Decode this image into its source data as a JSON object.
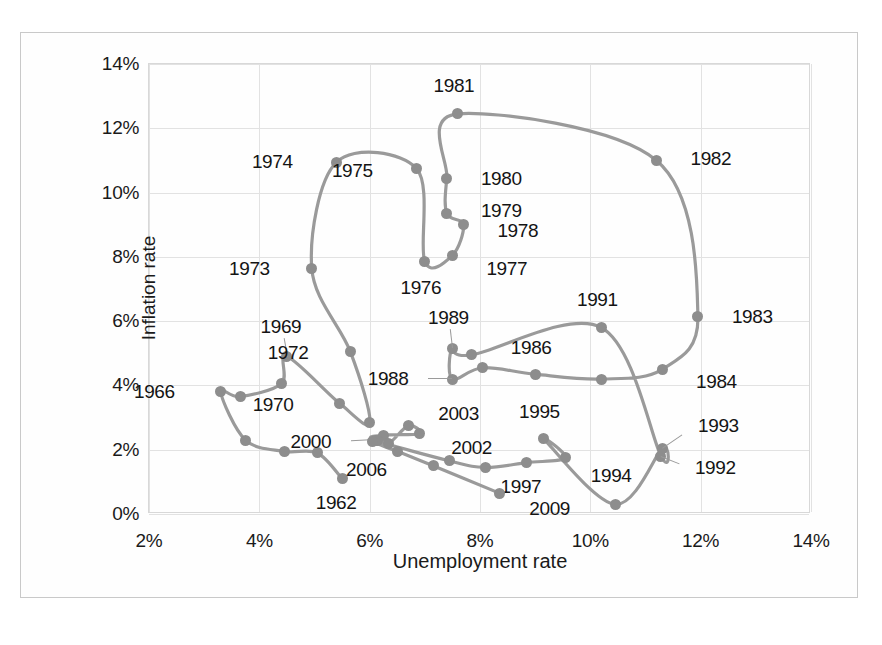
{
  "chart_data": {
    "type": "line",
    "title": "",
    "xlabel": "Unemployment rate",
    "ylabel": "Inflation rate",
    "xlim": [
      2,
      14
    ],
    "ylim": [
      0,
      14
    ],
    "xticks": [
      "2%",
      "4%",
      "6%",
      "8%",
      "10%",
      "12%",
      "14%"
    ],
    "yticks": [
      "0%",
      "2%",
      "4%",
      "6%",
      "8%",
      "10%",
      "12%",
      "14%"
    ],
    "grid": true,
    "legend": "none",
    "series_name": "Phillips curve path",
    "marker_color": "#8d8d8d",
    "line_color": "#9a9a9a",
    "points": [
      {
        "label": "1962",
        "x": 5.5,
        "y": 1.1,
        "lx": -6,
        "ly": 24,
        "anchor": "middle",
        "show": true
      },
      {
        "label": "1963",
        "x": 5.05,
        "y": 1.9,
        "show": false
      },
      {
        "label": "1964",
        "x": 4.45,
        "y": 1.95,
        "show": false
      },
      {
        "label": "1965",
        "x": 3.75,
        "y": 2.3,
        "show": false
      },
      {
        "label": "1966",
        "x": 3.3,
        "y": 3.8,
        "lx": -46,
        "ly": 0,
        "anchor": "end",
        "show": true
      },
      {
        "label": "1967",
        "x": 3.65,
        "y": 3.65,
        "show": false
      },
      {
        "label": "1968",
        "x": 4.4,
        "y": 4.05,
        "show": false
      },
      {
        "label": "1969",
        "x": 4.5,
        "y": 4.9,
        "lx": -6,
        "ly": -30,
        "anchor": "middle",
        "show": true,
        "leader": true
      },
      {
        "label": "1970",
        "x": 5.45,
        "y": 3.45,
        "lx": -46,
        "ly": 2,
        "anchor": "end",
        "show": true
      },
      {
        "label": "1971",
        "x": 6.0,
        "y": 2.85,
        "show": false
      },
      {
        "label": "1972",
        "x": 5.65,
        "y": 5.05,
        "lx": -42,
        "ly": 1,
        "anchor": "end",
        "show": true
      },
      {
        "label": "1973",
        "x": 4.95,
        "y": 7.65,
        "lx": -42,
        "ly": 1,
        "anchor": "end",
        "show": true
      },
      {
        "label": "1974",
        "x": 5.4,
        "y": 10.95,
        "lx": -44,
        "ly": 0,
        "anchor": "end",
        "show": true
      },
      {
        "label": "1975",
        "x": 6.85,
        "y": 10.75,
        "lx": -44,
        "ly": 3,
        "anchor": "end",
        "show": true
      },
      {
        "label": "1976",
        "x": 7.0,
        "y": 7.85,
        "lx": -4,
        "ly": 26,
        "anchor": "middle",
        "show": true
      },
      {
        "label": "1977",
        "x": 7.5,
        "y": 8.05,
        "lx": 34,
        "ly": 14,
        "anchor": "start",
        "show": true
      },
      {
        "label": "1978",
        "x": 7.7,
        "y": 9.0,
        "lx": 34,
        "ly": 6,
        "anchor": "start",
        "show": true
      },
      {
        "label": "1979",
        "x": 7.4,
        "y": 9.35,
        "lx": 34,
        "ly": -2,
        "anchor": "start",
        "show": true
      },
      {
        "label": "1980",
        "x": 7.4,
        "y": 10.45,
        "lx": 34,
        "ly": 1,
        "anchor": "start",
        "show": true
      },
      {
        "label": "1981",
        "x": 7.6,
        "y": 12.45,
        "lx": -4,
        "ly": -28,
        "anchor": "middle",
        "show": true
      },
      {
        "label": "1982",
        "x": 11.2,
        "y": 11.0,
        "lx": 34,
        "ly": -1,
        "anchor": "start",
        "show": true
      },
      {
        "label": "1983",
        "x": 11.95,
        "y": 6.15,
        "lx": 34,
        "ly": 1,
        "anchor": "start",
        "show": true
      },
      {
        "label": "1984",
        "x": 11.3,
        "y": 4.5,
        "lx": 34,
        "ly": 13,
        "anchor": "start",
        "show": true
      },
      {
        "label": "1985",
        "x": 10.2,
        "y": 4.2,
        "show": false
      },
      {
        "label": "1986",
        "x": 9.0,
        "y": 4.35,
        "lx": -4,
        "ly": -26,
        "anchor": "middle",
        "show": true
      },
      {
        "label": "1987",
        "x": 8.05,
        "y": 4.55,
        "show": false
      },
      {
        "label": "1988",
        "x": 7.5,
        "y": 4.2,
        "lx": -44,
        "ly": 0,
        "anchor": "end",
        "show": true,
        "leader": true
      },
      {
        "label": "1989",
        "x": 7.5,
        "y": 5.15,
        "lx": -4,
        "ly": -30,
        "anchor": "middle",
        "show": true,
        "leader": true
      },
      {
        "label": "1990",
        "x": 7.85,
        "y": 4.95,
        "show": false
      },
      {
        "label": "1991",
        "x": 10.2,
        "y": 5.8,
        "lx": -4,
        "ly": -28,
        "anchor": "middle",
        "show": true
      },
      {
        "label": "1992",
        "x": 11.28,
        "y": 1.8,
        "lx": 34,
        "ly": 12,
        "anchor": "start",
        "show": true,
        "leader": true
      },
      {
        "label": "1993",
        "x": 11.3,
        "y": 2.05,
        "lx": 36,
        "ly": -22,
        "anchor": "start",
        "show": true,
        "leader": true
      },
      {
        "label": "1994",
        "x": 10.45,
        "y": 0.3,
        "lx": -4,
        "ly": -28,
        "anchor": "middle",
        "show": true
      },
      {
        "label": "1995",
        "x": 9.15,
        "y": 2.35,
        "lx": -4,
        "ly": -26,
        "anchor": "middle",
        "show": true
      },
      {
        "label": "1996",
        "x": 9.55,
        "y": 1.75,
        "show": false
      },
      {
        "label": "1997",
        "x": 8.85,
        "y": 1.6,
        "lx": -6,
        "ly": 24,
        "anchor": "middle",
        "show": true
      },
      {
        "label": "1998",
        "x": 8.1,
        "y": 1.45,
        "show": false
      },
      {
        "label": "1999",
        "x": 7.45,
        "y": 1.65,
        "show": false
      },
      {
        "label": "2000",
        "x": 6.1,
        "y": 2.3,
        "lx": -44,
        "ly": 2,
        "anchor": "end",
        "show": true,
        "leader": true
      },
      {
        "label": "2001",
        "x": 6.25,
        "y": 2.45,
        "show": false
      },
      {
        "label": "2002",
        "x": 6.9,
        "y": 2.5,
        "lx": 32,
        "ly": 14,
        "anchor": "start",
        "show": true
      },
      {
        "label": "2003",
        "x": 6.7,
        "y": 2.75,
        "lx": 30,
        "ly": -12,
        "anchor": "start",
        "show": true
      },
      {
        "label": "2004",
        "x": 6.35,
        "y": 2.2,
        "show": false
      },
      {
        "label": "2005",
        "x": 6.15,
        "y": 2.3,
        "show": false
      },
      {
        "label": "2006",
        "x": 6.05,
        "y": 2.25,
        "lx": -6,
        "ly": 28,
        "anchor": "middle",
        "show": true
      },
      {
        "label": "2007",
        "x": 6.5,
        "y": 1.95,
        "show": false
      },
      {
        "label": "2008",
        "x": 7.15,
        "y": 1.5,
        "show": false
      },
      {
        "label": "2009",
        "x": 8.35,
        "y": 0.65,
        "lx": 30,
        "ly": 16,
        "anchor": "start",
        "show": true
      }
    ]
  }
}
